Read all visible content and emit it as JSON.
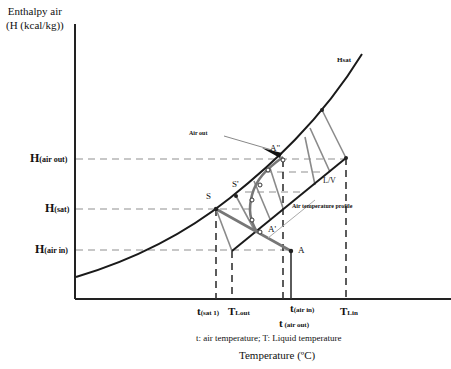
{
  "y_axis": {
    "label_line1": "Enthalpy air",
    "label_line2": "(H (kcal/kg))",
    "ticks": [
      {
        "main": "H",
        "sub": "(air out)"
      },
      {
        "main": "H",
        "sub": "(sat)"
      },
      {
        "main": "H",
        "sub": "(air in)"
      }
    ]
  },
  "x_axis": {
    "title": "Temperature (ºC)",
    "ticks": [
      {
        "main": "t",
        "sub": "(sat 1)"
      },
      {
        "main": "T",
        "sub": "Lout"
      },
      {
        "main": "t",
        "sub": "(air in)"
      },
      {
        "main": "t",
        "sub": " (air out)"
      },
      {
        "main": "T",
        "sub": "Lin"
      }
    ],
    "legend": "t: air temperature;  T: Liquid temperature"
  },
  "curve_label": "Hsat",
  "points": {
    "S": "S",
    "S_prime": "S'",
    "A_double_prime": "A\"",
    "A_prime": "A'",
    "A": "A",
    "LV": "L/V"
  },
  "annotations": {
    "air_out": "Air out",
    "air_temp_profile": "Air temperature profile"
  },
  "colors": {
    "curve": "#1a1a1a",
    "operating_line": "#1a1a1a",
    "tie_lines": "#8a8a8a",
    "dashed_guides": "#b5b5b5",
    "vertical_dashed": "#333333",
    "profile": "#777777"
  }
}
